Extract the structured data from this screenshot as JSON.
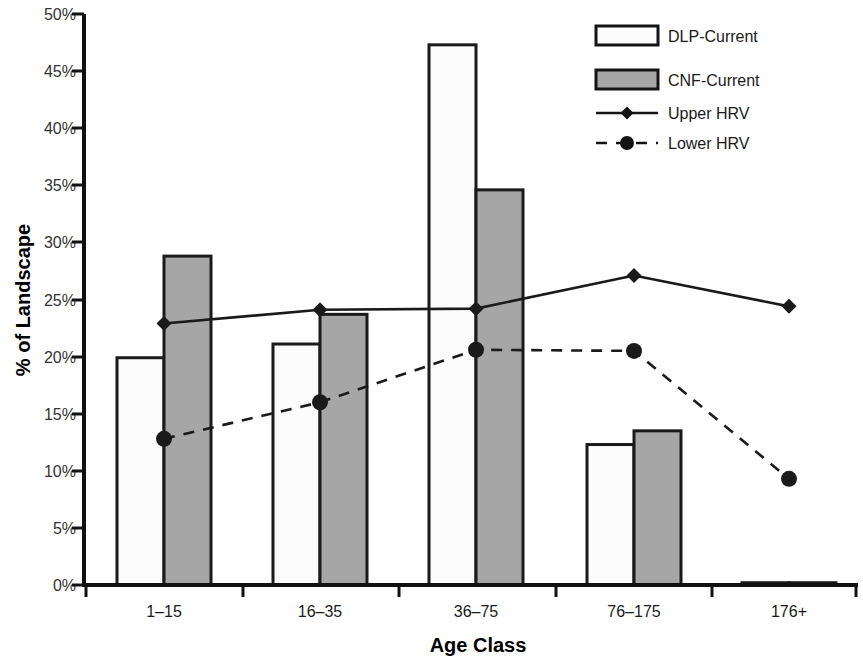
{
  "chart_data": {
    "type": "bar",
    "title": "",
    "xlabel": "Age Class",
    "ylabel": "% of Landscape",
    "categories": [
      "1–15",
      "16–35",
      "36–75",
      "76–175",
      "176+"
    ],
    "ylim": [
      0,
      50
    ],
    "ytick_labels": [
      "0%",
      "5%",
      "10%",
      "15%",
      "20%",
      "25%",
      "30%",
      "35%",
      "40%",
      "45%",
      "50%"
    ],
    "ytick_values": [
      0,
      5,
      10,
      15,
      20,
      25,
      30,
      35,
      40,
      45,
      50
    ],
    "grid": false,
    "legend_position": "top-right",
    "series": [
      {
        "name": "DLP-Current",
        "type": "bar",
        "marker": "white-bar",
        "color": "#fbfbfb",
        "edge_color": "#1a1a1a",
        "values": [
          19.9,
          21.1,
          47.3,
          12.3,
          0.2
        ]
      },
      {
        "name": "CNF-Current",
        "type": "bar",
        "marker": "gray-bar",
        "color": "#a6a6a6",
        "edge_color": "#1a1a1a",
        "values": [
          28.8,
          23.7,
          34.6,
          13.5,
          0.2
        ]
      },
      {
        "name": "Upper HRV",
        "type": "line",
        "line_style": "solid",
        "marker": "diamond",
        "color": "#1a1a1a",
        "values": [
          22.9,
          24.1,
          24.2,
          27.1,
          24.4
        ]
      },
      {
        "name": "Lower HRV",
        "type": "line",
        "line_style": "dashed",
        "marker": "circle",
        "color": "#1a1a1a",
        "values": [
          12.8,
          16.0,
          20.6,
          20.5,
          9.3
        ]
      }
    ]
  },
  "legend": {
    "items": [
      {
        "label": "DLP-Current",
        "swatch": "white-bar-swatch"
      },
      {
        "label": "CNF-Current",
        "swatch": "gray-bar-swatch"
      },
      {
        "label": "Upper HRV",
        "swatch": "solid-line-diamond-swatch"
      },
      {
        "label": "Lower HRV",
        "swatch": "dashed-line-circle-swatch"
      }
    ]
  },
  "axes": {
    "y_title": "% of Landscape",
    "x_title": "Age Class"
  }
}
